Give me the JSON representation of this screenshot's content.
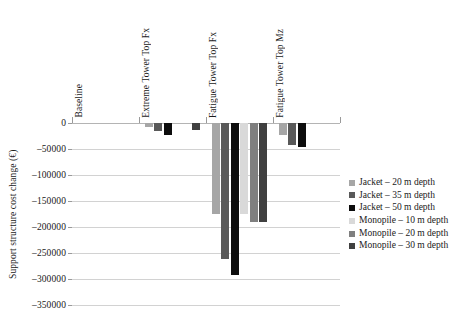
{
  "chart_data": {
    "type": "bar",
    "title": "",
    "xlabel": "",
    "ylabel": "Support structure cost change (€)",
    "categories": [
      "Baseline",
      "Extreme Tower Top Fx",
      "Fatigue Tower Top Fx",
      "Fatigue Tower Top Mz"
    ],
    "ylim": [
      -350000,
      0
    ],
    "ytick_labels": [
      "0",
      "–50000",
      "–100000",
      "–150000",
      "–200000",
      "–250000",
      "–300000",
      "–350000"
    ],
    "ytick_values": [
      0,
      -50000,
      -100000,
      -150000,
      -200000,
      -250000,
      -300000,
      -350000
    ],
    "grid": true,
    "legend_position": "right",
    "series": [
      {
        "name": "Jacket – 20 m depth",
        "color": "#a6a6a6",
        "values": [
          0,
          -7000,
          -175000,
          -24000
        ]
      },
      {
        "name": "Jacket – 35 m depth",
        "color": "#595959",
        "values": [
          0,
          -16000,
          -262000,
          -42000
        ]
      },
      {
        "name": "Jacket – 50 m depth",
        "color": "#0d0d0d",
        "values": [
          0,
          -23000,
          -292000,
          -47000
        ]
      },
      {
        "name": "Monopile – 10 m depth",
        "color": "#d9d9d9",
        "values": [
          0,
          0,
          -175000,
          0
        ]
      },
      {
        "name": "Monopile – 20 m depth",
        "color": "#7f7f7f",
        "values": [
          0,
          0,
          -190000,
          0
        ]
      },
      {
        "name": "Monopile – 30 m depth",
        "color": "#404040",
        "values": [
          0,
          -13000,
          -190000,
          0
        ]
      }
    ]
  }
}
